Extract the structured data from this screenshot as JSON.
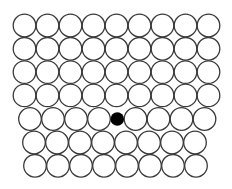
{
  "diagram": {
    "colors": {
      "background": "#ffffff",
      "stroke": "#3a3a3a",
      "defect": "#000000"
    },
    "circle_radius": 11.3,
    "stroke_width": 1.3,
    "rows": [
      {
        "cy": 25.5,
        "cx": [
          24.5,
          47.5,
          70.5,
          93.5,
          116.5,
          139.5,
          162.5,
          185.5,
          208.5
        ]
      },
      {
        "cy": 48.8,
        "cx": [
          24.5,
          47.5,
          70.5,
          93.5,
          116.5,
          139.5,
          162.5,
          185.5,
          208.5
        ]
      },
      {
        "cy": 72.1,
        "cx": [
          24.5,
          47.5,
          70.5,
          93.5,
          116.5,
          139.5,
          162.5,
          185.5,
          208.5
        ]
      },
      {
        "cy": 95.4,
        "cx": [
          24.5,
          47.5,
          70.5,
          93.5,
          116.5,
          139.5,
          162.5,
          185.5,
          208.5
        ]
      },
      {
        "cy": 119.0,
        "cx": [
          30.0,
          53.0,
          76.0,
          99.0,
          135.5,
          158.5,
          181.5,
          204.5
        ]
      },
      {
        "cy": 142.5,
        "cx": [
          34.0,
          57.0,
          80.0,
          103.0,
          126.0,
          149.0,
          172.0,
          195.0
        ]
      },
      {
        "cy": 165.8,
        "cx": [
          35.0,
          58.0,
          81.0,
          104.0,
          127.0,
          150.0,
          173.0,
          196.0
        ]
      }
    ],
    "defect": {
      "cx": 117.3,
      "cy": 119.0,
      "r": 6.8
    }
  }
}
